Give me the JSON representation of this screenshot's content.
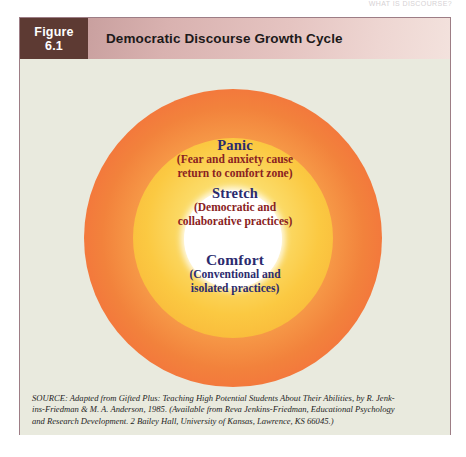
{
  "page": {
    "running_head": "WHAT IS DISCOURSE?"
  },
  "figure": {
    "number_line1": "Figure",
    "number_line2": "6.1",
    "title": "Democratic Discourse Growth Cycle",
    "colors": {
      "header_block": "#5d3a33",
      "title_bar_start": "#c9a09f",
      "title_bar_end": "#f3e2dd",
      "body_background": "#e9eade",
      "frame_border": "#9d7d85",
      "ring_outer": "#f4713c",
      "ring_middle": "#fbc942",
      "ring_inner": "#ffffff",
      "heading_text": "#2b2b6e",
      "subtext_red": "#8a2222"
    }
  },
  "diagram": {
    "type": "concentric-circles",
    "rings": [
      {
        "name": "panic",
        "heading": "Panic",
        "subtitle_line1": "(Fear and anxiety cause",
        "subtitle_line2": "return to comfort zone)"
      },
      {
        "name": "stretch",
        "heading": "Stretch",
        "subtitle_line1": "(Democratic and",
        "subtitle_line2": "collaborative practices)"
      },
      {
        "name": "comfort",
        "heading": "Comfort",
        "subtitle_line1": "(Conventional and",
        "subtitle_line2": "isolated practices)"
      }
    ]
  },
  "source": {
    "line1": "SOURCE: Adapted from Gifted Plus: Teaching High Potential Students About Their Abilities, by R. Jenk-",
    "line2": "ins-Friedman & M. A. Anderson, 1985. (Available from Reva Jenkins-Friedman, Educational Psychology",
    "line3": "and Research Development. 2 Bailey Hall, University of Kansas, Lawrence, KS 66045.)"
  }
}
